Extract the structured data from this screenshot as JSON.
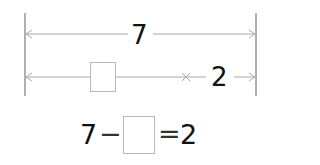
{
  "diagram": {
    "total_label": "7",
    "known_part_label": "2",
    "unknown_part": "",
    "line_color": "#aaaaaa",
    "bar_color": "#b0b0b0",
    "text_color": "#111111"
  },
  "equation": {
    "minuend": "7",
    "operator": "−",
    "blank": "",
    "equals": "=",
    "result": "2"
  }
}
